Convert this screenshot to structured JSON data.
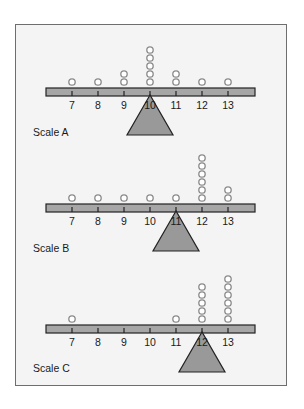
{
  "diagram": {
    "type": "balance-scales",
    "tick_values": [
      7,
      8,
      9,
      10,
      11,
      12,
      13
    ],
    "colors": {
      "frame_border": "#6e6e6e",
      "background": "#f4f4f4",
      "beam_fill": "#a6a6a6",
      "fulcrum_fill": "#999999",
      "stroke": "#222222",
      "circle_stroke": "#8a8a8a"
    },
    "scales": [
      {
        "label": "Scale A",
        "fulcrum_at": 10,
        "counts": {
          "7": 1,
          "8": 1,
          "9": 2,
          "10": 5,
          "11": 2,
          "12": 1,
          "13": 1
        }
      },
      {
        "label": "Scale B",
        "fulcrum_at": 11,
        "counts": {
          "7": 1,
          "8": 1,
          "9": 1,
          "10": 1,
          "11": 1,
          "12": 6,
          "13": 2
        }
      },
      {
        "label": "Scale C",
        "fulcrum_at": 12,
        "counts": {
          "7": 1,
          "8": 0,
          "9": 0,
          "10": 0,
          "11": 1,
          "12": 5,
          "13": 6
        }
      }
    ]
  }
}
